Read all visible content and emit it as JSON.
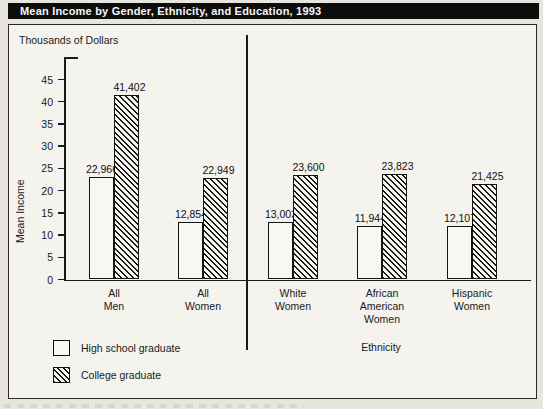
{
  "title": "Mean Income by Gender, Ethnicity, and Education, 1993",
  "chart_data": {
    "type": "bar",
    "title": "Mean Income by Gender, Ethnicity, and Education, 1993",
    "units": "Thousands of Dollars",
    "ylabel": "Mean Income",
    "ylim": [
      0,
      45
    ],
    "yticks": [
      0,
      5,
      10,
      15,
      20,
      25,
      30,
      35,
      40,
      45
    ],
    "grid": false,
    "legend_position": "bottom-left",
    "categories": [
      "All Men",
      "All Women",
      "White Women",
      "African American Women",
      "Hispanic Women"
    ],
    "category_lines": [
      [
        "All",
        "Men"
      ],
      [
        "All",
        "Women"
      ],
      [
        "White",
        "Women"
      ],
      [
        "African",
        "American",
        "Women"
      ],
      [
        "Hispanic",
        "Women"
      ]
    ],
    "group_axis_label": "Ethnicity",
    "divider_after_category": "All Women",
    "series": [
      {
        "name": "High school graduate",
        "pattern": "solid-white",
        "values": [
          22966,
          12854,
          13003,
          11944,
          12107
        ],
        "value_labels": [
          "22,966",
          "12,854",
          "13,003",
          "11,944",
          "12,107"
        ]
      },
      {
        "name": "College graduate",
        "pattern": "diagonal-hatch",
        "values": [
          41402,
          22949,
          23600,
          23823,
          21425
        ],
        "value_labels": [
          "41,402",
          "22,949",
          "23,600",
          "23,823",
          "21,425"
        ]
      }
    ]
  },
  "legend": {
    "items": [
      {
        "label": "High school graduate",
        "swatch": "solid-white"
      },
      {
        "label": "College graduate",
        "swatch": "diagonal-hatch"
      }
    ]
  },
  "colors": {
    "title_bar_bg": "#0d0d0d",
    "title_bar_text": "#f5f5f5",
    "page_bg": "#e8e5df",
    "chart_bg": "#f4f3ee",
    "bar_fill": "#f8f7f2",
    "ink": "#1a1a1a"
  }
}
